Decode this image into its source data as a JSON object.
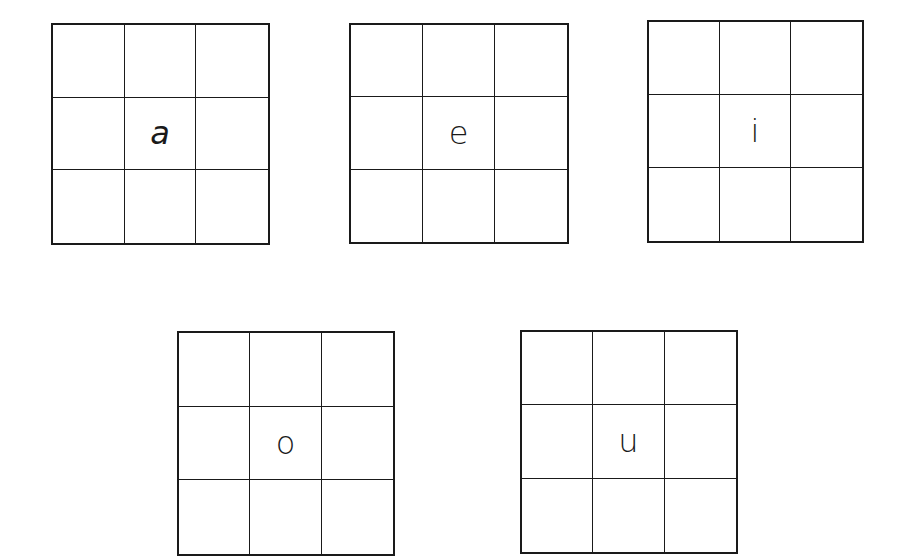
{
  "worksheet": {
    "grids": [
      {
        "id": "a",
        "center_letter": "a",
        "rows": 3,
        "cols": 3
      },
      {
        "id": "e",
        "center_letter": "e",
        "rows": 3,
        "cols": 3
      },
      {
        "id": "i",
        "center_letter": "i",
        "rows": 3,
        "cols": 3
      },
      {
        "id": "o",
        "center_letter": "o",
        "rows": 3,
        "cols": 3
      },
      {
        "id": "u",
        "center_letter": "u",
        "rows": 3,
        "cols": 3
      }
    ]
  },
  "colors": {
    "line": "#1a1a1a",
    "background": "#ffffff"
  }
}
